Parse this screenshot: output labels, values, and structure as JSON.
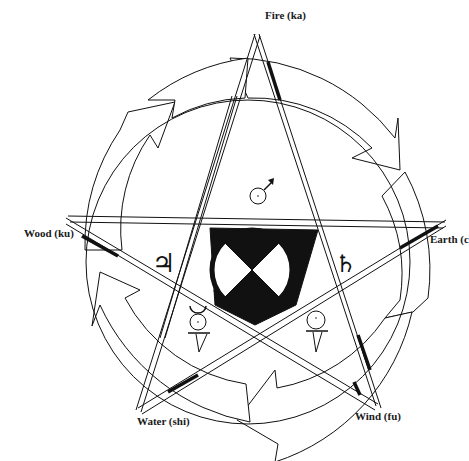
{
  "diagram": {
    "type": "five-element pentagram cycle",
    "elements": [
      {
        "id": "fire",
        "label": "Fire (ka)",
        "symbol": "mars",
        "symbol_glyph": "♂"
      },
      {
        "id": "earth",
        "label": "Earth (c",
        "symbol": "saturn",
        "symbol_glyph": "♄"
      },
      {
        "id": "wind",
        "label": "Wind (fu)",
        "symbol": "venus",
        "symbol_glyph": "♀"
      },
      {
        "id": "water",
        "label": "Water (shi)",
        "symbol": "mercury",
        "symbol_glyph": "☿"
      },
      {
        "id": "wood",
        "label": "Wood (ku)",
        "symbol": "jupiter",
        "symbol_glyph": "♃"
      }
    ],
    "outer_cycle": "clockwise arrows around ring",
    "center": "checkered circle with four rotating arrows",
    "colors": {
      "ink": "#111111",
      "paper": "#ffffff"
    }
  }
}
